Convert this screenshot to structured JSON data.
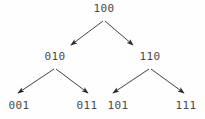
{
  "diagram": {
    "type": "binary-tree",
    "background_color": "#fefefe",
    "label_color": "#4a4a4a",
    "edge_color": "#2b2b2b",
    "nodes": [
      {
        "id": "root",
        "label": "100",
        "x": 104,
        "y": 9,
        "level": 0
      },
      {
        "id": "l",
        "label": "010",
        "x": 55,
        "y": 57,
        "level": 1
      },
      {
        "id": "r",
        "label": "110",
        "x": 150,
        "y": 57,
        "level": 1
      },
      {
        "id": "ll",
        "label": "001",
        "x": 19,
        "y": 106,
        "level": 2
      },
      {
        "id": "lr",
        "label": "011",
        "x": 87,
        "y": 106,
        "level": 2
      },
      {
        "id": "rl",
        "label": "101",
        "x": 118,
        "y": 106,
        "level": 2
      },
      {
        "id": "rr",
        "label": "111",
        "x": 186,
        "y": 106,
        "level": 2
      }
    ],
    "edges": [
      {
        "id": "edge-root-l",
        "from": "root",
        "to": "l",
        "x1": 103,
        "y1": 21,
        "x2": 71,
        "y2": 45,
        "arrowhead": "filled-triangle"
      },
      {
        "id": "edge-root-r",
        "from": "root",
        "to": "r",
        "x1": 105,
        "y1": 21,
        "x2": 133,
        "y2": 45,
        "arrowhead": "filled-triangle"
      },
      {
        "id": "edge-l-ll",
        "from": "l",
        "to": "ll",
        "x1": 54,
        "y1": 69,
        "x2": 18,
        "y2": 93,
        "arrowhead": "filled-triangle"
      },
      {
        "id": "edge-l-lr",
        "from": "l",
        "to": "lr",
        "x1": 56,
        "y1": 69,
        "x2": 88,
        "y2": 93,
        "arrowhead": "filled-triangle"
      },
      {
        "id": "edge-r-rl",
        "from": "r",
        "to": "rl",
        "x1": 149,
        "y1": 69,
        "x2": 113,
        "y2": 93,
        "arrowhead": "filled-triangle"
      },
      {
        "id": "edge-r-rr",
        "from": "r",
        "to": "rr",
        "x1": 151,
        "y1": 69,
        "x2": 184,
        "y2": 93,
        "arrowhead": "filled-triangle"
      }
    ]
  }
}
